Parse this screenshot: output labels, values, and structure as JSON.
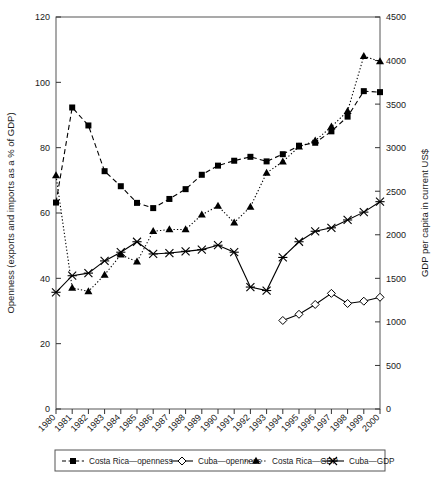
{
  "axes": {
    "left": {
      "title": "Openness (exports and imports as a % of GDP)",
      "ticks": [
        "0",
        "20",
        "40",
        "60",
        "80",
        "100",
        "120"
      ],
      "min": 0,
      "max": 120
    },
    "right": {
      "title": "GDP per capita in current US$",
      "ticks": [
        "0",
        "500",
        "1000",
        "1500",
        "2000",
        "2500",
        "3000",
        "3500",
        "4000",
        "4500"
      ],
      "min": 0,
      "max": 4500
    },
    "bottom": {
      "ticks": [
        "1980",
        "1981",
        "1982",
        "1983",
        "1984",
        "1985",
        "1986",
        "1987",
        "1988",
        "1989",
        "1990",
        "1991",
        "1992",
        "1993",
        "1994",
        "1995",
        "1996",
        "1997",
        "1998",
        "1999",
        "2000"
      ]
    }
  },
  "legend": {
    "items": [
      {
        "label": "Costa Rica—openness",
        "marker": "filled-square-icon",
        "line": "dashed",
        "color": "#000000"
      },
      {
        "label": "Cuba—openness",
        "marker": "open-diamond-icon",
        "line": "solid",
        "color": "#000000"
      },
      {
        "label": "Costa Rica—GDP",
        "marker": "filled-triangle-icon",
        "line": "dotted",
        "color": "#000000"
      },
      {
        "label": "Cuba—GDP",
        "marker": "cross-star-icon",
        "line": "solid",
        "color": "#000000"
      }
    ]
  },
  "chart_data": {
    "type": "line",
    "title": "",
    "xlabel": "",
    "ylabel": "Openness (exports and imports as a % of GDP)",
    "y2label": "GDP per capita in current US$",
    "grid": false,
    "legend_position": "bottom",
    "xlim": [
      1980,
      2000
    ],
    "ylim": [
      0,
      120
    ],
    "y2lim": [
      0,
      4500
    ],
    "x": [
      1980,
      1981,
      1982,
      1983,
      1984,
      1985,
      1986,
      1987,
      1988,
      1989,
      1990,
      1991,
      1992,
      1993,
      1994,
      1995,
      1996,
      1997,
      1998,
      1999,
      2000
    ],
    "series": [
      {
        "name": "Costa Rica—openness",
        "axis": "left",
        "unit": "% of GDP",
        "marker": "filled-square",
        "linestyle": "dashed",
        "values": [
          63.2,
          92.3,
          86.8,
          72.8,
          68.2,
          63.1,
          61.5,
          64.3,
          67.3,
          71.7,
          74.5,
          76.0,
          77.2,
          75.8,
          78.0,
          80.6,
          81.5,
          85.0,
          89.5,
          97.3,
          97.0
        ]
      },
      {
        "name": "Cuba—openness",
        "axis": "left",
        "unit": "% of GDP",
        "marker": "open-diamond",
        "linestyle": "solid",
        "values": [
          null,
          null,
          null,
          null,
          null,
          null,
          null,
          null,
          null,
          null,
          null,
          null,
          null,
          null,
          27.1,
          29.0,
          32.0,
          35.4,
          32.3,
          33.0,
          34.2
        ]
      },
      {
        "name": "Costa Rica—GDP",
        "axis": "right",
        "unit": "US$ per capita",
        "marker": "filled-triangle",
        "linestyle": "dotted",
        "values": [
          2680,
          1390,
          1350,
          1540,
          1770,
          1690,
          2040,
          2060,
          2060,
          2230,
          2330,
          2140,
          2320,
          2710,
          2840,
          3010,
          3080,
          3240,
          3420,
          4050,
          3990
        ]
      },
      {
        "name": "Cuba—GDP",
        "axis": "right",
        "unit": "US$ per capita",
        "marker": "cross-star",
        "linestyle": "solid",
        "values": [
          1340,
          1530,
          1560,
          1700,
          1800,
          1920,
          1780,
          1790,
          1810,
          1830,
          1880,
          1800,
          1400,
          1360,
          1740,
          1920,
          2040,
          2080,
          2170,
          2260,
          2380
        ]
      }
    ]
  }
}
